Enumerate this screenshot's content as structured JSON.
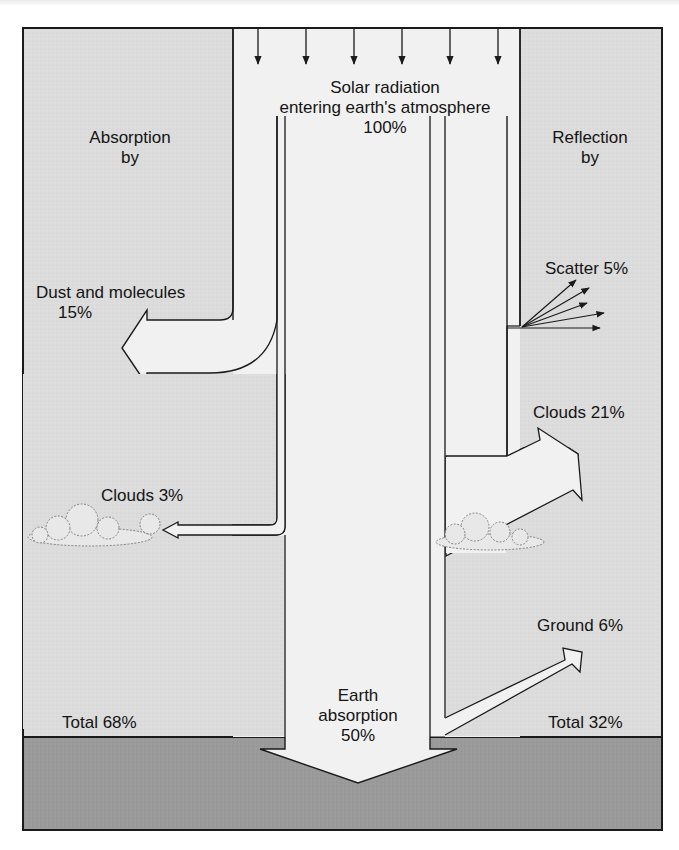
{
  "diagram": {
    "colors": {
      "background": "#ffffff",
      "atmosphere_panel": "#dcdcdc",
      "beam_fill": "#f1f1f1",
      "ground": "#9a9a9a",
      "outline": "#1a1a1a"
    },
    "incoming": {
      "line1": "Solar radiation",
      "line2": "entering earth's atmosphere",
      "percent": "100%",
      "arrow_count": 6
    },
    "absorption": {
      "heading_line1": "Absorption",
      "heading_line2": "by",
      "dust_label": "Dust and molecules",
      "dust_percent": "15%",
      "clouds_label": "Clouds 3%",
      "total_label": "Total 68%"
    },
    "reflection": {
      "heading_line1": "Reflection",
      "heading_line2": "by",
      "scatter_label": "Scatter 5%",
      "clouds_label": "Clouds 21%",
      "ground_label": "Ground 6%",
      "total_label": "Total 32%"
    },
    "earth": {
      "line1": "Earth",
      "line2": "absorption",
      "percent": "50%"
    },
    "icons": {
      "incoming_arrows": "down-arrow-icon",
      "scatter_arrows": "scatter-arrows-icon",
      "clouds": "cloud-icon"
    }
  }
}
